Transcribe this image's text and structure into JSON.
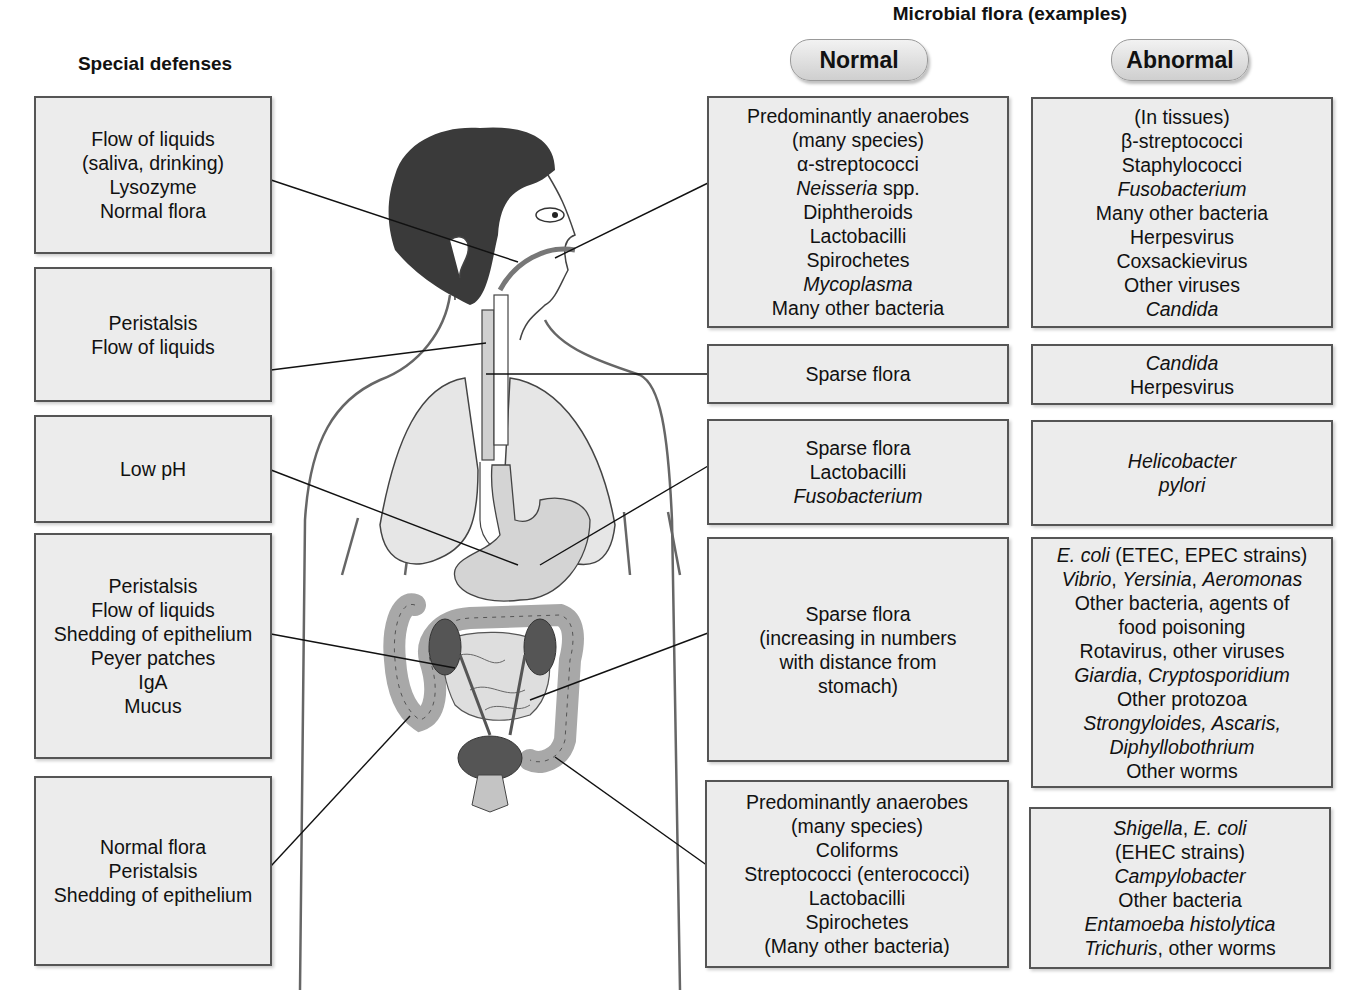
{
  "headings": {
    "special_defenses": "Special defenses",
    "microbial_flora": "Microbial flora (examples)",
    "normal": "Normal",
    "abnormal": "Abnormal"
  },
  "special_defenses": [
    {
      "region": "mouth",
      "lines": [
        "Flow of liquids",
        "(saliva, drinking)",
        "Lysozyme",
        "Normal flora"
      ]
    },
    {
      "region": "esophagus",
      "lines": [
        "Peristalsis",
        "Flow of liquids"
      ]
    },
    {
      "region": "stomach",
      "lines": [
        "Low pH"
      ]
    },
    {
      "region": "small-intestine",
      "lines": [
        "Peristalsis",
        "Flow of liquids",
        "Shedding of epithelium",
        "Peyer patches",
        "IgA",
        "Mucus"
      ]
    },
    {
      "region": "large-intestine",
      "lines": [
        "Normal flora",
        "Peristalsis",
        "Shedding of epithelium"
      ]
    }
  ],
  "normal_flora": [
    {
      "region": "mouth",
      "lines": [
        "Predominantly anaerobes",
        "(many species)",
        "α-streptococci",
        "Neisseria spp.",
        "Diphtheroids",
        "Lactobacilli",
        "Spirochetes",
        "Mycoplasma",
        "Many other bacteria"
      ]
    },
    {
      "region": "esophagus",
      "lines": [
        "Sparse flora"
      ]
    },
    {
      "region": "stomach",
      "lines": [
        "Sparse flora",
        "Lactobacilli",
        "Fusobacterium"
      ]
    },
    {
      "region": "small-intestine",
      "lines": [
        "Sparse flora",
        "(increasing in numbers",
        "with distance from",
        "stomach)"
      ]
    },
    {
      "region": "large-intestine",
      "lines": [
        "Predominantly anaerobes",
        "(many species)",
        "Coliforms",
        "Streptococci (enterococci)",
        "Lactobacilli",
        "Spirochetes",
        "(Many other bacteria)"
      ]
    }
  ],
  "abnormal_flora": [
    {
      "region": "mouth",
      "lines": [
        "(In tissues)",
        "β-streptococci",
        "Staphylococci",
        "Fusobacterium",
        "Many other bacteria",
        "Herpesvirus",
        "Coxsackievirus",
        "Other viruses",
        "Candida"
      ]
    },
    {
      "region": "esophagus",
      "lines": [
        "Candida",
        "Herpesvirus"
      ]
    },
    {
      "region": "stomach",
      "lines": [
        "Helicobacter",
        "pylori"
      ]
    },
    {
      "region": "small-intestine",
      "lines": [
        "E. coli (ETEC, EPEC strains)",
        "Vibrio, Yersinia, Aeromonas",
        "Other bacteria, agents of",
        "food poisoning",
        "Rotavirus, other viruses",
        "Giardia, Cryptosporidium",
        "Other protozoa",
        "Strongyloides, Ascaris,",
        "Diphyllobothrium",
        "Other worms"
      ]
    },
    {
      "region": "large-intestine",
      "lines": [
        "Shigella, E. coli",
        "(EHEC strains)",
        "Campylobacter",
        "Other bacteria",
        "Entamoeba histolytica",
        "Trichuris, other worms"
      ]
    }
  ],
  "colors": {
    "box_fill": "#ececec",
    "box_border": "#555555",
    "organ_light": "#d6d6d6",
    "organ_mid": "#b5b5b5",
    "organ_dark": "#555555",
    "hair": "#3a3a3a"
  }
}
